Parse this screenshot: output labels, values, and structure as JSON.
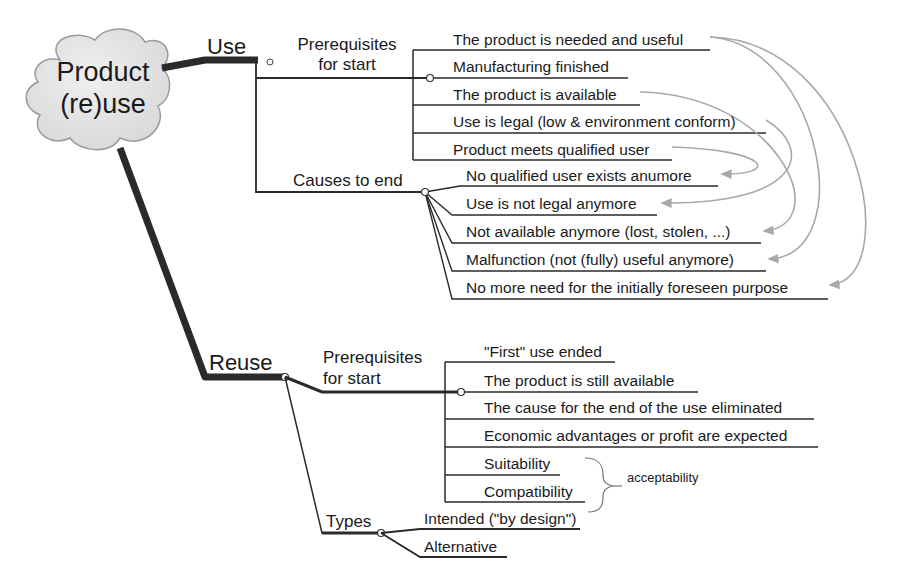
{
  "central": {
    "line1": "Product",
    "line2": "(re)use"
  },
  "use": {
    "label": "Use",
    "prerequisites": {
      "label_line1": "Prerequisites",
      "label_line2": "for start",
      "items": [
        "The product is needed and useful",
        "Manufacturing finished",
        "The product is available",
        "Use is legal (low & environment conform)",
        "Product meets qualified user"
      ]
    },
    "causes_to_end": {
      "label": "Causes to end",
      "items": [
        "No qualified user exists anumore",
        "Use is not legal anymore",
        "Not available anymore (lost, stolen, ...)",
        "Malfunction (not (fully) useful anymore)",
        "No more need for the initially foreseen purpose"
      ]
    }
  },
  "reuse": {
    "label": "Reuse",
    "prerequisites": {
      "label_line1": "Prerequisites",
      "label_line2": "for start",
      "items": [
        "\"First\" use ended",
        "The product is still available",
        "The cause for the end of the use eliminated",
        "Economic advantages or profit are expected",
        "Suitability",
        "Compatibility"
      ],
      "group_annotation": "acceptability"
    },
    "types": {
      "label": "Types",
      "items": [
        "Intended (\"by design\")",
        "Alternative"
      ]
    }
  },
  "colors": {
    "thick_branch": "#2a2a2a",
    "line": "#2a2a2a",
    "relation_arrow": "#a8a8a8",
    "cloud_fill": "#e4e4e4",
    "cloud_stroke": "#9a9a9a"
  }
}
